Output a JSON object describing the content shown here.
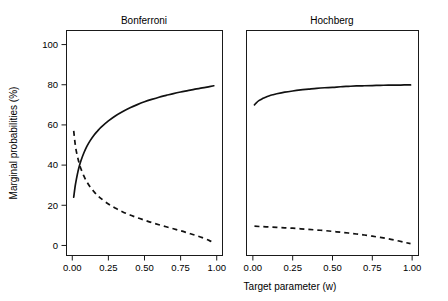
{
  "figure": {
    "background": "#ffffff",
    "line_color": "#111111",
    "frame_color": "#1a1a1a"
  },
  "chart_data": {
    "type": "line",
    "title": "",
    "xlabel": "Target parameter (w)",
    "ylabel": "Marginal probabilities (%)",
    "xlim": [
      -0.04,
      1.04
    ],
    "ylim": [
      -5,
      107
    ],
    "xticks": [
      0.0,
      0.25,
      0.5,
      0.75,
      1.0
    ],
    "xticklabels": [
      "0.00",
      "0.25",
      "0.50",
      "0.75",
      "1.00"
    ],
    "yticks": [
      0,
      20,
      40,
      60,
      80,
      100
    ],
    "yticklabels": [
      "0",
      "20",
      "40",
      "60",
      "80",
      "100"
    ],
    "grid": false,
    "legend": "none",
    "panels": [
      {
        "label": "Bonferroni",
        "series": [
          {
            "name": "solid",
            "linestyle": "solid",
            "x": [
              0.01,
              0.02,
              0.03,
              0.04,
              0.05,
              0.06,
              0.08,
              0.1,
              0.125,
              0.15,
              0.175,
              0.2,
              0.25,
              0.3,
              0.35,
              0.4,
              0.45,
              0.5,
              0.55,
              0.6,
              0.65,
              0.7,
              0.75,
              0.8,
              0.85,
              0.9,
              0.95,
              0.98
            ],
            "y": [
              24.0,
              29.5,
              33.5,
              37.0,
              39.8,
              42.2,
              46.0,
              49.2,
              52.3,
              54.9,
              57.0,
              58.9,
              62.0,
              64.6,
              66.7,
              68.5,
              70.1,
              71.5,
              72.7,
              73.8,
              74.7,
              75.6,
              76.4,
              77.1,
              77.8,
              78.4,
              79.1,
              79.5
            ]
          },
          {
            "name": "dashed",
            "linestyle": "dashed",
            "x": [
              0.01,
              0.02,
              0.03,
              0.04,
              0.05,
              0.06,
              0.08,
              0.1,
              0.125,
              0.15,
              0.175,
              0.2,
              0.25,
              0.3,
              0.35,
              0.4,
              0.45,
              0.5,
              0.55,
              0.6,
              0.65,
              0.7,
              0.75,
              0.8,
              0.85,
              0.9,
              0.95,
              0.98
            ],
            "y": [
              57.0,
              50.5,
              46.2,
              43.0,
              40.4,
              38.2,
              34.6,
              31.8,
              29.0,
              26.8,
              24.9,
              23.3,
              20.6,
              18.5,
              16.7,
              15.2,
              13.8,
              12.6,
              11.4,
              10.3,
              9.3,
              8.3,
              7.3,
              6.2,
              5.1,
              3.9,
              2.4,
              1.2
            ]
          }
        ]
      },
      {
        "label": "Hochberg",
        "series": [
          {
            "name": "solid",
            "linestyle": "solid",
            "x": [
              0.01,
              0.02,
              0.04,
              0.06,
              0.08,
              0.1,
              0.125,
              0.15,
              0.2,
              0.25,
              0.3,
              0.35,
              0.4,
              0.45,
              0.5,
              0.55,
              0.6,
              0.65,
              0.7,
              0.75,
              0.8,
              0.85,
              0.9,
              0.95,
              0.99
            ],
            "y": [
              70.0,
              70.9,
              72.2,
              73.1,
              73.8,
              74.4,
              75.0,
              75.5,
              76.3,
              76.9,
              77.4,
              77.8,
              78.2,
              78.5,
              78.7,
              79.0,
              79.2,
              79.4,
              79.5,
              79.6,
              79.7,
              79.8,
              79.8,
              79.9,
              79.9
            ]
          },
          {
            "name": "dashed",
            "linestyle": "dashed",
            "x": [
              0.01,
              0.05,
              0.1,
              0.15,
              0.2,
              0.25,
              0.3,
              0.35,
              0.4,
              0.45,
              0.5,
              0.55,
              0.6,
              0.65,
              0.7,
              0.75,
              0.8,
              0.85,
              0.9,
              0.95,
              0.99
            ],
            "y": [
              9.6,
              9.4,
              9.2,
              9.0,
              8.8,
              8.6,
              8.3,
              8.0,
              7.7,
              7.4,
              7.0,
              6.6,
              6.2,
              5.7,
              5.2,
              4.6,
              4.0,
              3.3,
              2.5,
              1.6,
              0.9
            ]
          }
        ]
      }
    ]
  }
}
